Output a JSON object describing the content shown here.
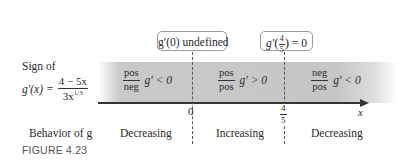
{
  "figure": {
    "caption": "FIGURE 4.23",
    "row_label_sign": "Sign of",
    "formula": {
      "lhs": "g′(x) =",
      "numerator": "4 − 5x",
      "denominator": "3x",
      "denominator_exp": "1/3"
    },
    "row_label_behavior": "Behavior of g",
    "axis_variable": "x",
    "critical_points": [
      {
        "label": "0",
        "callout": "g′(0) undefined"
      },
      {
        "label_num": "4",
        "label_den": "5",
        "callout_prefix": "g′",
        "callout_num": "4",
        "callout_den": "5",
        "callout_suffix": "= 0"
      }
    ],
    "intervals": [
      {
        "num": "pos",
        "den": "neg",
        "sign": "g′ < 0",
        "behavior": "Decreasing"
      },
      {
        "num": "pos",
        "den": "pos",
        "sign": "g′ > 0",
        "behavior": "Increasing"
      },
      {
        "num": "neg",
        "den": "pos",
        "sign": "g′ < 0",
        "behavior": "Decreasing"
      }
    ],
    "colors": {
      "band": "#c8c8c8",
      "axis": "#333333",
      "caption": "#555555"
    }
  }
}
